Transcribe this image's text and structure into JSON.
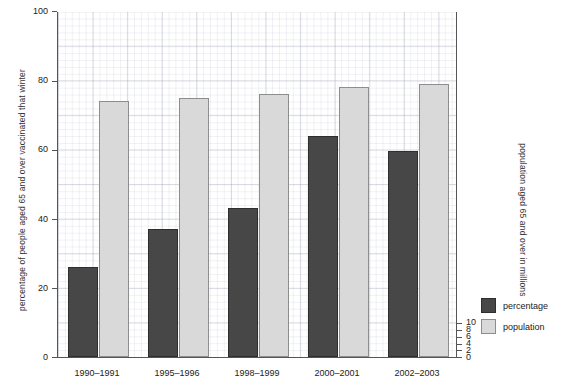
{
  "chart_data": {
    "type": "bar",
    "title": "",
    "subtitle": "",
    "xlabel": "",
    "ylabel": "percentage of people aged 65 and over vaccinated that winter",
    "ylabel_right": "population aged 65 and over in millions",
    "categories": [
      "1990–1991",
      "1995–1996",
      "1998–1999",
      "2000–2001",
      "2002–2003"
    ],
    "series": [
      {
        "name": "percentage",
        "axis": "left",
        "color": "#474747",
        "values": [
          26,
          37,
          43,
          64,
          59.5
        ]
      },
      {
        "name": "population",
        "axis": "right",
        "color": "#d9d9d9",
        "values": [
          7.4,
          7.5,
          7.6,
          7.8,
          7.9
        ]
      }
    ],
    "ylim": [
      0,
      100
    ],
    "ylim_right": [
      0,
      10
    ],
    "yticks": [
      0,
      20,
      40,
      60,
      80,
      100
    ],
    "yticks_right": [
      0,
      2,
      4,
      6,
      8,
      10
    ],
    "ytick_labels": [
      "0",
      "20",
      "40",
      "60",
      "80",
      "100"
    ],
    "ytick_labels_right": [
      "0",
      "2",
      "4",
      "6",
      "8",
      "10"
    ],
    "grid": true,
    "grid_minor": true,
    "legend_position": "right-bottom",
    "legend_entries": [
      "percentage",
      "population"
    ]
  }
}
